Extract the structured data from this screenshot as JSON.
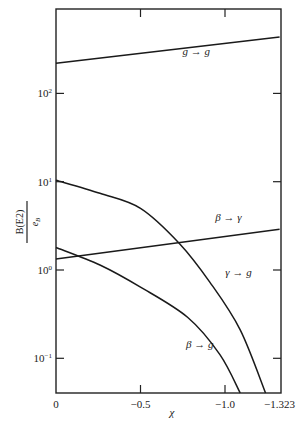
{
  "chart_data": {
    "type": "line",
    "title": "",
    "xlabel": "χ",
    "ylabel": {
      "numerator": "B(E2)",
      "denominator": "e",
      "denominator_sub": "B",
      "denominator_sup": "2"
    },
    "yscale": "log",
    "xlim": [
      0,
      -1.323
    ],
    "ylim": [
      0.03,
      600
    ],
    "x_ticks": [
      {
        "value": 0,
        "label": "0"
      },
      {
        "value": -0.5,
        "label": "−0.5"
      },
      {
        "value": -1.0,
        "label": "−1.0"
      },
      {
        "value": -1.323,
        "label": "−1.323"
      }
    ],
    "y_ticks": [
      {
        "value": 100,
        "base": "10",
        "exp": "2"
      },
      {
        "value": 10,
        "base": "10",
        "exp": "1"
      },
      {
        "value": 1,
        "base": "10",
        "exp": "0"
      },
      {
        "value": 0.1,
        "base": "10",
        "exp": "−1"
      }
    ],
    "grid": false,
    "legend": "inline labels",
    "series": [
      {
        "name": "g → g",
        "x": [
          0,
          -1.323
        ],
        "y": [
          220,
          436
        ]
      },
      {
        "name": "β → γ",
        "x": [
          0,
          -1.323
        ],
        "y": [
          1.33,
          2.9
        ]
      },
      {
        "name": "γ → g",
        "x": [
          0,
          -0.26,
          -0.5,
          -0.73,
          -0.91,
          -1.09,
          -1.24
        ],
        "y": [
          10.4,
          7.4,
          5.0,
          2.0,
          0.73,
          0.21,
          0.04
        ]
      },
      {
        "name": "β → g",
        "x": [
          0,
          -0.26,
          -0.5,
          -0.78,
          -0.97,
          -1.09
        ],
        "y": [
          1.8,
          1.14,
          0.64,
          0.29,
          0.11,
          0.04
        ]
      }
    ],
    "annotations": [
      {
        "text": "g → g",
        "x": -0.83,
        "y": 270
      },
      {
        "text": "β → γ",
        "x": -1.02,
        "y": 3.6
      },
      {
        "text": "γ → g",
        "x": -1.08,
        "y": 0.85
      },
      {
        "text": "β → g",
        "x": -0.85,
        "y": 0.13
      }
    ]
  }
}
